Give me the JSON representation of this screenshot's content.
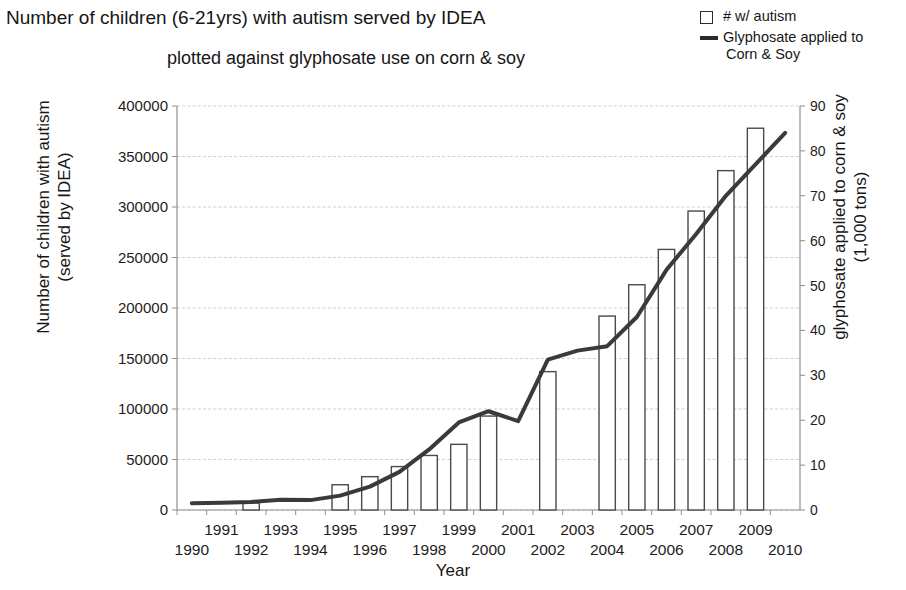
{
  "title": {
    "line1": "Number of children (6-21yrs) with autism served by IDEA",
    "line2": "plotted against glyphosate use on corn & soy"
  },
  "legend": {
    "items": [
      {
        "marker": "open-square",
        "label": "# w/ autism",
        "label2": ""
      },
      {
        "marker": "line",
        "label": "Glyphosate applied to",
        "label2": "Corn & Soy"
      }
    ]
  },
  "axes": {
    "x_label": "Year",
    "y_left_label_line1": "Number of children with autism",
    "y_left_label_line2": "(served by IDEA)",
    "y_right_label_line1": "glyphosate applied to corn & soy",
    "y_right_label_line2": "(1,000 tons)"
  },
  "colors": {
    "line": "#3a3a3a",
    "bar_stroke": "#4a4a4a",
    "bar_fill": "#ffffff",
    "grid": "#c9c9c9",
    "axis": "#8f8f8f",
    "text": "#161616"
  },
  "chart_data": {
    "type": "bar",
    "title": "Number of children (6-21yrs) with autism served by IDEA plotted against glyphosate use on corn & soy",
    "xlabel": "Year",
    "ylabel": "Number of children with autism (served by IDEA)",
    "y2label": "glyphosate applied to corn & soy (1,000 tons)",
    "grid": true,
    "legend_position": "top-right",
    "x": [
      1990,
      1991,
      1992,
      1993,
      1994,
      1995,
      1996,
      1997,
      1998,
      1999,
      2000,
      2001,
      2002,
      2003,
      2004,
      2005,
      2006,
      2007,
      2008,
      2009,
      2010
    ],
    "xlim": [
      1989.5,
      2010.5
    ],
    "x_tick_labels_top_row": [
      "1991",
      "1993",
      "1995",
      "1997",
      "1999",
      "2001",
      "2003",
      "2005",
      "2007",
      "2009"
    ],
    "x_tick_labels_bottom_row": [
      "1990",
      "1992",
      "1994",
      "1996",
      "1998",
      "2000",
      "2002",
      "2004",
      "2006",
      "2008",
      "2010"
    ],
    "ylim": [
      0,
      400000
    ],
    "y_ticks": [
      0,
      50000,
      100000,
      150000,
      200000,
      250000,
      300000,
      350000,
      400000
    ],
    "y_tick_labels": [
      "0",
      "50000",
      "100000",
      "150000",
      "200000",
      "250000",
      "300000",
      "350000",
      "400000"
    ],
    "y2lim": [
      0,
      90
    ],
    "y2_ticks": [
      0,
      10,
      20,
      30,
      40,
      50,
      60,
      70,
      80,
      90
    ],
    "y2_tick_labels": [
      "0",
      "10",
      "20",
      "30",
      "40",
      "50",
      "60",
      "70",
      "80",
      "90"
    ],
    "series": [
      {
        "name": "# w/ autism",
        "type": "bar",
        "axis": "left",
        "categories": [
          1990,
          1991,
          1992,
          1993,
          1994,
          1995,
          1996,
          1997,
          1998,
          1999,
          2000,
          2001,
          2002,
          2003,
          2004,
          2005,
          2006,
          2007,
          2008,
          2009,
          2010
        ],
        "values": [
          null,
          null,
          7000,
          null,
          null,
          25000,
          33000,
          43000,
          54000,
          65000,
          93000,
          null,
          137000,
          null,
          192000,
          223000,
          258000,
          296000,
          336000,
          378000,
          null
        ]
      },
      {
        "name": "Glyphosate applied to Corn & Soy",
        "type": "line",
        "axis": "right",
        "x": [
          1990,
          1991,
          1992,
          1993,
          1994,
          1995,
          1996,
          1997,
          1998,
          1999,
          2000,
          2001,
          2002,
          2003,
          2004,
          2005,
          2006,
          2007,
          2008,
          2009,
          2010
        ],
        "values": [
          1.5,
          1.6,
          1.8,
          2.3,
          2.2,
          3.2,
          5.2,
          8.5,
          13.5,
          19.5,
          22.0,
          19.8,
          33.5,
          35.5,
          36.5,
          43.0,
          53.5,
          61.5,
          70.0,
          77.0,
          84.0
        ]
      }
    ]
  }
}
